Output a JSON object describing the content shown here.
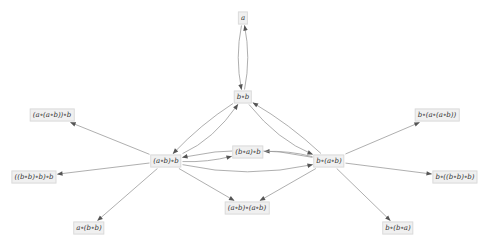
{
  "graph": {
    "colors": {
      "edge": "#9a9a9a",
      "arrow": "#555555",
      "node_bg": "#f0f0f0",
      "node_border": "#dcdcdc",
      "text": "#333333"
    },
    "nodes": [
      {
        "id": "n_a",
        "label": "a"
      },
      {
        "id": "n_bb",
        "label": "b∘b"
      },
      {
        "id": "n_aabb",
        "label": "(a∘(a∘b))∘b"
      },
      {
        "id": "n_baab",
        "label": "b∘(a∘(a∘b))"
      },
      {
        "id": "n_bbbb",
        "label": "((b∘b)∘b)∘b"
      },
      {
        "id": "n_abb",
        "label": "(a∘b)∘b"
      },
      {
        "id": "n_bab",
        "label": "(b∘a)∘b"
      },
      {
        "id": "n_bab2",
        "label": "b∘(a∘b)"
      },
      {
        "id": "n_bbbb2",
        "label": "b∘((b∘b)∘b)"
      },
      {
        "id": "n_abab",
        "label": "(a∘b)∘(a∘b)"
      },
      {
        "id": "n_abb2",
        "label": "a∘(b∘b)"
      },
      {
        "id": "n_bba",
        "label": "b∘(b∘a)"
      }
    ],
    "edges": [
      {
        "from": "n_bb",
        "to": "n_a"
      },
      {
        "from": "n_a",
        "to": "n_bb"
      },
      {
        "from": "n_abb",
        "to": "n_bb"
      },
      {
        "from": "n_bb",
        "to": "n_abb"
      },
      {
        "from": "n_bab2",
        "to": "n_bb"
      },
      {
        "from": "n_bb",
        "to": "n_bab2"
      },
      {
        "from": "n_abb",
        "to": "n_aabb"
      },
      {
        "from": "n_abb",
        "to": "n_bbbb"
      },
      {
        "from": "n_abb",
        "to": "n_abb2"
      },
      {
        "from": "n_abb",
        "to": "n_abab"
      },
      {
        "from": "n_abb",
        "to": "n_bab"
      },
      {
        "from": "n_bab2",
        "to": "n_baab"
      },
      {
        "from": "n_bab2",
        "to": "n_bbbb2"
      },
      {
        "from": "n_bab2",
        "to": "n_bba"
      },
      {
        "from": "n_bab2",
        "to": "n_abab"
      },
      {
        "from": "n_bab2",
        "to": "n_bab"
      },
      {
        "from": "n_abb",
        "to": "n_bab2"
      },
      {
        "from": "n_bab2",
        "to": "n_abb"
      }
    ]
  }
}
